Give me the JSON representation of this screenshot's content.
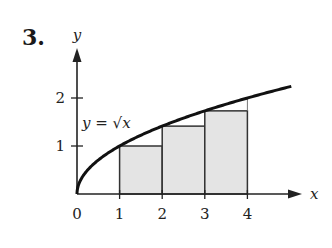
{
  "problem": {
    "number": "3."
  },
  "colors": {
    "axis": "#222222",
    "curve": "#111111",
    "rect_fill": "#e4e4e4",
    "rect_stroke": "#333333"
  },
  "chart_data": {
    "type": "area",
    "title": "",
    "xlabel": "x",
    "ylabel": "y",
    "curve_label": "y = √x",
    "curve": {
      "function": "sqrt(x)",
      "x_range": [
        0,
        5.03
      ]
    },
    "x_ticks": [
      "0",
      "1",
      "2",
      "3",
      "4"
    ],
    "y_ticks": [
      "1",
      "2"
    ],
    "xlim": [
      0,
      5.4
    ],
    "ylim": [
      0,
      3.0
    ],
    "grid": false,
    "rectangles": [
      {
        "x0": 1,
        "x1": 2,
        "height": 1.0
      },
      {
        "x0": 2,
        "x1": 3,
        "height": 1.414
      },
      {
        "x0": 3,
        "x1": 4,
        "height": 1.732
      }
    ],
    "annotations": [
      "Left-endpoint rectangles under y = √x on [1, 4]"
    ]
  }
}
